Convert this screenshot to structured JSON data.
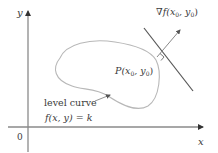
{
  "diagram": {
    "axes": {
      "x_label": "x",
      "y_label": "y",
      "origin_label": "0"
    },
    "gradient_label": {
      "nabla": "∇",
      "f": "f",
      "args": "(x",
      "sub1": "0",
      "sep": ", y",
      "sub2": "0",
      "close": ")"
    },
    "point_label": {
      "P": "P",
      "args": "(x",
      "sub1": "0",
      "sep": ", y",
      "sub2": "0",
      "close": ")"
    },
    "curve_label": {
      "line1": "level curve",
      "line2": "f(x, y) = k"
    },
    "colors": {
      "axis": "#7a7a7a",
      "curve": "#b5b5b5",
      "tangent": "#555555",
      "gradient_arrow": "#888888",
      "text": "#3a3a3a"
    }
  }
}
